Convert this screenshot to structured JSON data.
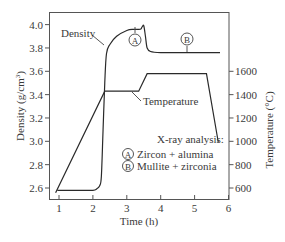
{
  "chart_data": {
    "type": "line",
    "title": "",
    "xlabel": "Time (h)",
    "ylabel": "Density (g/cm3)",
    "ylabel_parts": {
      "main": "Density (g/cm",
      "sup": "3",
      "end": ")"
    },
    "y2label": "Temperature (°C)",
    "xlim": [
      0.7,
      6
    ],
    "ylim": [
      2.5,
      4.1
    ],
    "y2lim": [
      500,
      2100
    ],
    "xticks": [
      "1",
      "2",
      "3",
      "4",
      "5",
      "6"
    ],
    "yticks": [
      "2.6",
      "2.8",
      "3.0",
      "3.2",
      "3.4",
      "3.6",
      "3.8",
      "4.0"
    ],
    "y2ticks": [
      "600",
      "800",
      "1000",
      "1200",
      "1400",
      "1600"
    ],
    "grid": false,
    "series": [
      {
        "name": "Density",
        "axis": "left",
        "x": [
          0.95,
          1.5,
          2.0,
          2.1,
          2.2,
          2.25,
          2.3,
          2.35,
          2.4,
          2.5,
          2.7,
          3.0,
          3.2,
          3.4,
          3.45,
          3.5,
          3.55,
          3.6,
          3.7,
          4.0,
          4.5,
          5.0,
          5.5,
          5.75
        ],
        "values": [
          2.58,
          2.58,
          2.58,
          2.59,
          2.62,
          2.7,
          3.1,
          3.5,
          3.75,
          3.83,
          3.9,
          3.95,
          3.96,
          3.96,
          3.98,
          3.99,
          3.9,
          3.8,
          3.77,
          3.76,
          3.76,
          3.76,
          3.76,
          3.76
        ]
      },
      {
        "name": "Temperature",
        "axis": "right",
        "x": [
          0.9,
          2.35,
          3.35,
          3.6,
          5.35,
          5.7
        ],
        "values": [
          560,
          1430,
          1430,
          1580,
          1580,
          990
        ]
      }
    ],
    "annotations": [
      {
        "label": "Density",
        "at": [
          1.25,
          3.98
        ],
        "arrow_to": [
          2.42,
          3.83
        ]
      },
      {
        "label": "Temperature",
        "at": [
          3.55,
          1300
        ],
        "arrow_to": [
          3.05,
          1410
        ]
      },
      {
        "label": "A",
        "circled": true,
        "at": [
          3.0,
          3.92
        ],
        "pointer_to": [
          3.0,
          3.96
        ]
      },
      {
        "label": "B",
        "circled": true,
        "at": [
          4.75,
          3.8
        ],
        "pointer_to": [
          4.75,
          3.76
        ]
      }
    ],
    "legend": {
      "title": "X-ray analysis:",
      "items": [
        {
          "marker": "A",
          "text": "Zircon + alumina"
        },
        {
          "marker": "B",
          "text": "Mullite + zirconia"
        }
      ],
      "position": "lower right inside"
    }
  }
}
